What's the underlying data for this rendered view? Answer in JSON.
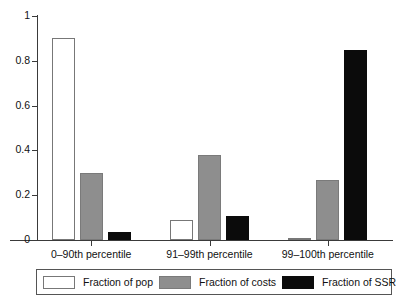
{
  "chart_data": {
    "type": "bar",
    "title": "",
    "subtitle": "",
    "xlabel": "",
    "ylabel": "",
    "ylim": [
      0,
      1
    ],
    "yticks": [
      "0",
      "0.2",
      "0.4",
      "0.6",
      "0.8",
      "1"
    ],
    "ytick_values": [
      0,
      0.2,
      0.4,
      0.6,
      0.8,
      1
    ],
    "grid": false,
    "legend_position": "bottom",
    "categories": [
      "0–90th percentile",
      "91–99th percentile",
      "99–100th percentile"
    ],
    "series": [
      {
        "name": "Fraction of pop",
        "color": "#ffffff",
        "values": [
          0.9,
          0.09,
          0.008
        ]
      },
      {
        "name": "Fraction of costs",
        "color": "#8e8e8e",
        "values": [
          0.3,
          0.38,
          0.27
        ]
      },
      {
        "name": "Fraction of SSR",
        "color": "#0b0b0b",
        "values": [
          0.035,
          0.105,
          0.85
        ]
      }
    ]
  },
  "axes": {
    "y_ticks": [
      {
        "label": "1",
        "value": 1
      },
      {
        "label": "0.8",
        "value": 0.8
      },
      {
        "label": "0.6",
        "value": 0.6
      },
      {
        "label": "0.4",
        "value": 0.4
      },
      {
        "label": "0.2",
        "value": 0.2
      },
      {
        "label": "0",
        "value": 0
      }
    ]
  },
  "legend": {
    "entries": [
      {
        "label": "Fraction of pop",
        "color": "#ffffff"
      },
      {
        "label": "Fraction of costs",
        "color": "#8e8e8e"
      },
      {
        "label": "Fraction of SSR",
        "color": "#0b0b0b"
      }
    ]
  }
}
